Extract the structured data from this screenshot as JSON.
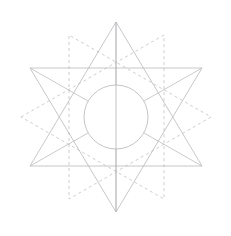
{
  "figure": {
    "kind": "line-drawing",
    "background_color": "#ffffff",
    "canvas": {
      "width": 231,
      "height": 236
    },
    "center": {
      "x": 116,
      "y": 117
    },
    "stroke_colors": {
      "solid_star": "#b9b9bd",
      "dashed_star": "#c2c2c6",
      "circle": "#b5b5b9",
      "spokes": "#bcbcc0",
      "vertical_axis": "#b4b4b8"
    },
    "stroke_widths": {
      "solid_star": 0.8,
      "dashed_star": 0.8,
      "circle": 0.8,
      "spokes": 0.8,
      "vertical_axis": 0.8
    },
    "dash_pattern": "3 3",
    "circle": {
      "label": "inner-circle",
      "cx": 116,
      "cy": 117,
      "r": 32
    },
    "solid_star": {
      "label": "solid-hexagram",
      "outer_radius": 95,
      "rotation_degrees": 0,
      "points": [
        {
          "name": "top-apex",
          "x": 116,
          "y": 22
        },
        {
          "name": "upper-right",
          "x": 202,
          "y": 68
        },
        {
          "name": "lower-right",
          "x": 202,
          "y": 166
        },
        {
          "name": "bottom-apex",
          "x": 116,
          "y": 212
        },
        {
          "name": "lower-left",
          "x": 30,
          "y": 166
        },
        {
          "name": "upper-left",
          "x": 30,
          "y": 68
        }
      ],
      "triangle_a": [
        {
          "x": 116,
          "y": 22
        },
        {
          "x": 202,
          "y": 166
        },
        {
          "x": 30,
          "y": 166
        }
      ],
      "triangle_b": [
        {
          "x": 116,
          "y": 212
        },
        {
          "x": 30,
          "y": 68
        },
        {
          "x": 202,
          "y": 68
        }
      ]
    },
    "dashed_star": {
      "label": "dashed-hexagram",
      "outer_radius": 95,
      "rotation_degrees": 30,
      "points": [
        {
          "name": "right-apex",
          "x": 211,
          "y": 117
        },
        {
          "name": "lower-right",
          "x": 164,
          "y": 199
        },
        {
          "name": "lower-left",
          "x": 69,
          "y": 199
        },
        {
          "name": "left-apex",
          "x": 21,
          "y": 117
        },
        {
          "name": "upper-left",
          "x": 69,
          "y": 35
        },
        {
          "name": "upper-right",
          "x": 164,
          "y": 35
        }
      ],
      "triangle_a": [
        {
          "x": 211,
          "y": 117
        },
        {
          "x": 69,
          "y": 199
        },
        {
          "x": 69,
          "y": 35
        }
      ],
      "triangle_b": [
        {
          "x": 21,
          "y": 117
        },
        {
          "x": 164,
          "y": 35
        },
        {
          "x": 164,
          "y": 199
        }
      ]
    },
    "vertical_axis": {
      "label": "vertical-axis-line",
      "x": 116,
      "y1": 22,
      "y2": 212
    },
    "spokes": [
      {
        "name": "spoke-up",
        "angle_degrees": 270,
        "x1": 116,
        "y1": 85,
        "x2": 116,
        "y2": 22
      },
      {
        "name": "spoke-down",
        "angle_degrees": 90,
        "x1": 116,
        "y1": 149,
        "x2": 116,
        "y2": 212
      },
      {
        "name": "spoke-upper-right",
        "angle_degrees": 330,
        "x1": 144,
        "y1": 101,
        "x2": 202,
        "y2": 68
      },
      {
        "name": "spoke-lower-right",
        "angle_degrees": 30,
        "x1": 144,
        "y1": 133,
        "x2": 202,
        "y2": 166
      },
      {
        "name": "spoke-upper-left",
        "angle_degrees": 210,
        "x1": 88,
        "y1": 101,
        "x2": 30,
        "y2": 68
      },
      {
        "name": "spoke-lower-left",
        "angle_degrees": 150,
        "x1": 88,
        "y1": 133,
        "x2": 30,
        "y2": 166
      }
    ]
  }
}
